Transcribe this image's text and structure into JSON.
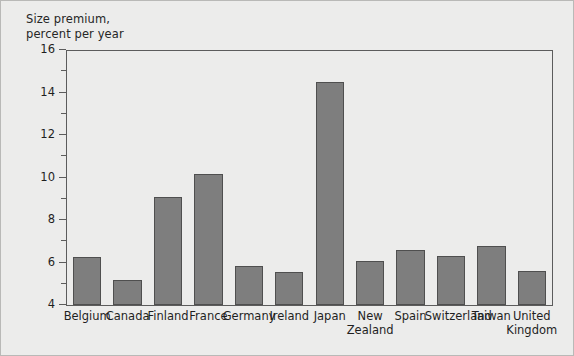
{
  "chart_data": {
    "type": "bar",
    "title": "",
    "ylabel": "Size premium,\npercent per year",
    "xlabel": "",
    "ylim": [
      4,
      16
    ],
    "ytick_step_major": 2,
    "ytick_step_minor": 1,
    "ytick_labels": [
      "4",
      "6",
      "8",
      "10",
      "12",
      "14",
      "16"
    ],
    "grid": false,
    "legend": null,
    "categories": [
      "Belgium",
      "Canada",
      "Finland",
      "France",
      "Germany",
      "Ireland",
      "Japan",
      "New\nZealand",
      "Spain",
      "Switzerland",
      "Taiwan",
      "United\nKingdom"
    ],
    "values": [
      6.25,
      5.2,
      9.1,
      10.15,
      5.85,
      5.55,
      14.5,
      6.05,
      6.6,
      6.3,
      6.8,
      5.6
    ],
    "bar_color": "#7e7e7e",
    "bar_edge_color": "#4f4f4f",
    "plot_background": "#ececeb",
    "axis_color": "#5c5c5c"
  },
  "axis_title_text": "Size premium,\npercent per year"
}
